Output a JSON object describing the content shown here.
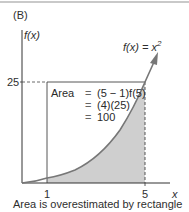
{
  "panel": {
    "label": "(B)",
    "caption": "Area is overestimated by rectangle"
  },
  "axes": {
    "y_label": "f(x)",
    "x_label": "x",
    "y_tick": "25",
    "x_ticks": [
      "1",
      "5"
    ]
  },
  "function": {
    "label_base": "f(x) = x",
    "label_exp": "2"
  },
  "area_box": {
    "rows": [
      {
        "key": "Area",
        "eq": "=",
        "value": "(5 − 1)f(5)"
      },
      {
        "key": "",
        "eq": "=",
        "value": "(4)(25)"
      },
      {
        "key": "",
        "eq": "=",
        "value": "100"
      }
    ]
  },
  "colors": {
    "axis": "#333333",
    "curve": "#777777",
    "shade": "#cfcfcf",
    "rule": "#c9c9c9"
  }
}
